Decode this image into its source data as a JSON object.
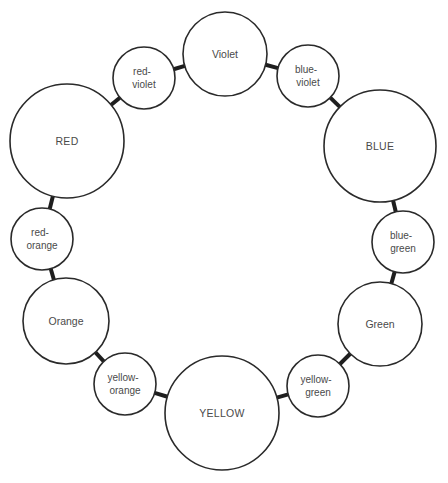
{
  "diagram": {
    "type": "color-wheel",
    "stroke_color": "#2a2a2a",
    "background": "#ffffff",
    "nodes": [
      {
        "id": "violet",
        "line1": "Violet",
        "line2": "",
        "cx": 225,
        "cy": 54,
        "r": 42,
        "size": "md"
      },
      {
        "id": "blue-violet",
        "line1": "blue-",
        "line2": "violet",
        "cx": 308,
        "cy": 76,
        "r": 31,
        "size": "sm"
      },
      {
        "id": "blue",
        "line1": "BLUE",
        "line2": "",
        "cx": 380,
        "cy": 146,
        "r": 56,
        "size": "lg"
      },
      {
        "id": "blue-green",
        "line1": "blue-",
        "line2": "green",
        "cx": 403,
        "cy": 242,
        "r": 31,
        "size": "sm"
      },
      {
        "id": "green",
        "line1": "Green",
        "line2": "",
        "cx": 380,
        "cy": 324,
        "r": 42,
        "size": "md"
      },
      {
        "id": "yellow-green",
        "line1": "yellow-",
        "line2": "green",
        "cx": 318,
        "cy": 386,
        "r": 31,
        "size": "sm"
      },
      {
        "id": "yellow",
        "line1": "YELLOW",
        "line2": "",
        "cx": 222,
        "cy": 413,
        "r": 57,
        "size": "lg"
      },
      {
        "id": "yellow-orange",
        "line1": "yellow-",
        "line2": "orange",
        "cx": 125,
        "cy": 384,
        "r": 31,
        "size": "sm"
      },
      {
        "id": "orange",
        "line1": "Orange",
        "line2": "",
        "cx": 66,
        "cy": 321,
        "r": 43,
        "size": "md"
      },
      {
        "id": "red-orange",
        "line1": "red-",
        "line2": "orange",
        "cx": 42,
        "cy": 239,
        "r": 31,
        "size": "sm"
      },
      {
        "id": "red",
        "line1": "RED",
        "line2": "",
        "cx": 67,
        "cy": 141,
        "r": 57,
        "size": "lg"
      },
      {
        "id": "red-violet",
        "line1": "red-",
        "line2": "violet",
        "cx": 144,
        "cy": 78,
        "r": 31,
        "size": "sm"
      }
    ],
    "links": [
      [
        "violet",
        "blue-violet"
      ],
      [
        "blue-violet",
        "blue"
      ],
      [
        "blue",
        "blue-green"
      ],
      [
        "blue-green",
        "green"
      ],
      [
        "green",
        "yellow-green"
      ],
      [
        "yellow-green",
        "yellow"
      ],
      [
        "yellow",
        "yellow-orange"
      ],
      [
        "yellow-orange",
        "orange"
      ],
      [
        "orange",
        "red-orange"
      ],
      [
        "red-orange",
        "red"
      ],
      [
        "red",
        "red-violet"
      ],
      [
        "red-violet",
        "violet"
      ]
    ]
  }
}
